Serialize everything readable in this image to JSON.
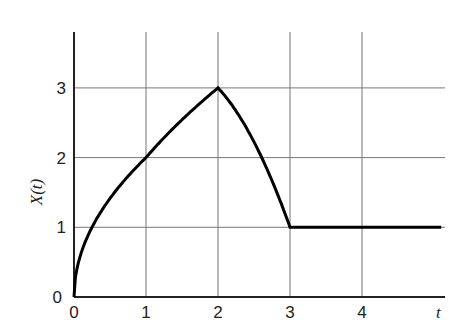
{
  "chart_data": {
    "type": "line",
    "title": "",
    "xlabel": "t",
    "ylabel": "X(t)",
    "xlim": [
      0,
      5.1
    ],
    "ylim": [
      0,
      3.8
    ],
    "grid": true,
    "x_ticks": [
      "0",
      "1",
      "2",
      "3",
      "4"
    ],
    "y_ticks": [
      "0",
      "1",
      "2",
      "3"
    ],
    "series": [
      {
        "name": "X(t)",
        "color": "#000000",
        "points": [
          [
            0,
            0
          ],
          [
            0.0625,
            0.5
          ],
          [
            0.25,
            1.0
          ],
          [
            0.5,
            1.41
          ],
          [
            0.75,
            1.73
          ],
          [
            1,
            2.0
          ],
          [
            1.25,
            2.24
          ],
          [
            1.5,
            2.47
          ],
          [
            1.75,
            2.72
          ],
          [
            2,
            3.0
          ],
          [
            2.25,
            2.66
          ],
          [
            2.5,
            2.2
          ],
          [
            2.75,
            1.64
          ],
          [
            3,
            1.0
          ],
          [
            4,
            1.0
          ],
          [
            5.1,
            1.0
          ]
        ],
        "description": "Increases concavely from (0,0) through (1,2) to peak (2,3); decreases concavely to (3,1); constant at 1 thereafter"
      }
    ]
  }
}
